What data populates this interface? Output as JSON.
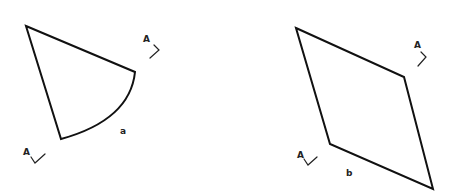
{
  "diagram": {
    "background": "#ffffff",
    "stroke_color": "#111111",
    "figures": [
      {
        "id": "a",
        "label": "a",
        "shape": "circular-sector",
        "vertices": [
          [
            26,
            26
          ],
          [
            135,
            72
          ],
          [
            61,
            139
          ]
        ],
        "arc": "from (135,72) curving to (61,139)",
        "section_markers": [
          {
            "label": "A",
            "position": "upper-right"
          },
          {
            "label": "A",
            "position": "lower-left"
          }
        ]
      },
      {
        "id": "b",
        "label": "b",
        "shape": "rhombus",
        "vertices": [
          [
            296,
            28
          ],
          [
            404,
            77
          ],
          [
            433,
            189
          ],
          [
            330,
            144
          ]
        ],
        "section_markers": [
          {
            "label": "A",
            "position": "upper-right"
          },
          {
            "label": "A",
            "position": "lower-left"
          }
        ]
      }
    ],
    "labels": {
      "fig_a": "a",
      "fig_b": "b",
      "section_a_tr": "A",
      "section_a_bl": "A",
      "section_b_tr": "A",
      "section_b_bl": "A"
    }
  }
}
